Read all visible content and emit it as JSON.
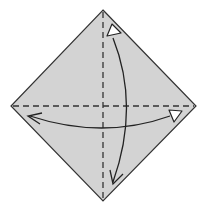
{
  "diagram": {
    "type": "origami-fold-instruction",
    "colors": {
      "paper": "#d3d3d3",
      "outline": "#333333",
      "dash": "#333333",
      "arrow": "#222222",
      "arrow_head_fill": "#ffffff"
    },
    "shape": {
      "top": [
        103,
        10
      ],
      "right": [
        196,
        106
      ],
      "bottom": [
        103,
        201
      ],
      "left": [
        11,
        106
      ]
    },
    "creases": [
      {
        "name": "vertical-crease",
        "style": "dashed",
        "from": [
          103,
          10
        ],
        "to": [
          103,
          201
        ]
      },
      {
        "name": "horizontal-crease",
        "style": "dashed",
        "from": [
          11,
          106
        ],
        "to": [
          196,
          106
        ]
      }
    ],
    "arrows": [
      {
        "name": "vertical-fold-unfold-arrow",
        "from": "bottom",
        "to": "top",
        "head_top": "hollow-triangle",
        "head_bottom": "open-v"
      },
      {
        "name": "horizontal-fold-unfold-arrow",
        "from": "left",
        "to": "right",
        "head_left": "open-v",
        "head_right": "hollow-triangle"
      }
    ]
  }
}
